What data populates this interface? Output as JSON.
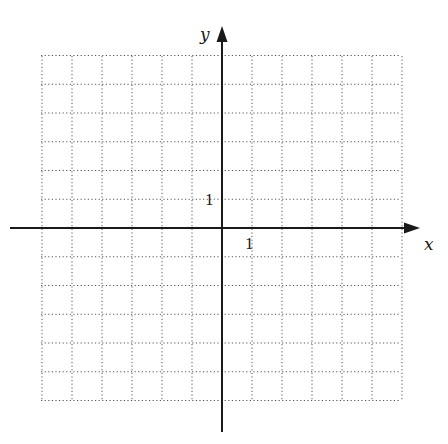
{
  "chart_data": {
    "type": "scatter",
    "title": "",
    "xlabel": "x",
    "ylabel": "y",
    "xlim": [
      -6,
      6
    ],
    "ylim": [
      -6,
      6
    ],
    "grid": true,
    "grid_style": "dotted",
    "x_tick_labels": [
      {
        "value": 1,
        "label": "1"
      }
    ],
    "y_tick_labels": [
      {
        "value": 1,
        "label": "1"
      }
    ],
    "series": [],
    "legend": null
  },
  "labels": {
    "x_axis": "x",
    "y_axis": "y",
    "x_tick_one": "1",
    "y_tick_one": "1"
  },
  "colors": {
    "axis": "#1a1a1a",
    "grid": "#555555",
    "background": "#ffffff"
  }
}
